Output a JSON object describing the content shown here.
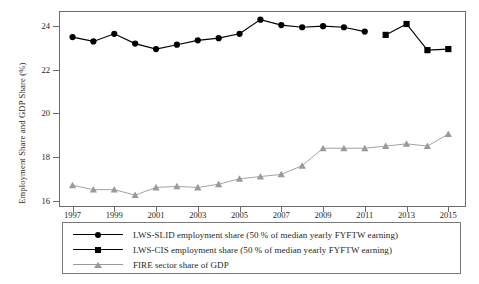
{
  "chart_data": {
    "type": "line",
    "title": "",
    "xlabel": "",
    "ylabel": "Employment Share and GDP Share (%)",
    "ylabel_main": "Employment Share and GDP Share",
    "ylabel_unit": "(%)",
    "xlim": [
      1996.4,
      2015.8
    ],
    "ylim": [
      15.75,
      24.65
    ],
    "yticks": [
      16,
      18,
      20,
      22,
      24
    ],
    "xticks": [
      1997,
      1999,
      2001,
      2003,
      2005,
      2007,
      2009,
      2011,
      2013,
      2015
    ],
    "grid": false,
    "legend_position": "below-axes",
    "x": [
      1997,
      1998,
      1999,
      2000,
      2001,
      2002,
      2003,
      2004,
      2005,
      2006,
      2007,
      2008,
      2009,
      2010,
      2011,
      2012,
      2013,
      2014,
      2015
    ],
    "series": [
      {
        "name": "LWS-SLID employment share (50 % of median yearly FYFTW earning)",
        "short_name": "LWS-SLID employment share",
        "marker": "circle",
        "color": "#000000",
        "x": [
          1997,
          1998,
          1999,
          2000,
          2001,
          2002,
          2003,
          2004,
          2005,
          2006,
          2007,
          2008,
          2009,
          2010,
          2011
        ],
        "values": [
          23.5,
          23.3,
          23.65,
          23.2,
          22.95,
          23.15,
          23.35,
          23.45,
          23.65,
          24.3,
          24.05,
          23.95,
          24.0,
          23.95,
          23.75
        ]
      },
      {
        "name": "LWS-CIS employment share (50 % of median yearly FYFTW earning)",
        "short_name": "LWS-CIS employment share",
        "marker": "square",
        "color": "#000000",
        "x": [
          2012,
          2013,
          2014,
          2015
        ],
        "values": [
          23.6,
          24.1,
          22.9,
          22.95
        ]
      },
      {
        "name": "FIRE sector share of GDP",
        "short_name": "FIRE sector share of GDP",
        "marker": "triangle",
        "color": "#9a9a9a",
        "x": [
          1997,
          1998,
          1999,
          2000,
          2001,
          2002,
          2003,
          2004,
          2005,
          2006,
          2007,
          2008,
          2009,
          2010,
          2011,
          2012,
          2013,
          2014,
          2015
        ],
        "values": [
          16.7,
          16.5,
          16.5,
          16.25,
          16.6,
          16.65,
          16.6,
          16.75,
          17.0,
          17.1,
          17.2,
          17.6,
          18.4,
          18.4,
          18.4,
          18.5,
          18.6,
          18.5,
          19.05
        ]
      }
    ]
  },
  "legend": {
    "items": [
      {
        "label": "LWS-SLID employment share (50 % of median yearly FYFTW earning)",
        "marker": "circle",
        "color": "#000000"
      },
      {
        "label": "LWS-CIS employment share (50 % of median yearly FYFTW earning)",
        "marker": "square",
        "color": "#000000"
      },
      {
        "label": "FIRE sector share of GDP",
        "marker": "triangle",
        "color": "#9a9a9a"
      }
    ]
  }
}
